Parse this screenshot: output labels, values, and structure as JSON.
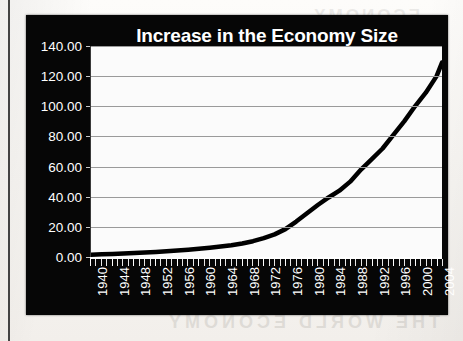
{
  "page": {
    "bleed_top_text": "ECONOMY",
    "bleed_bottom_text": "THE WORLD ECONOMY"
  },
  "chart_panel": {
    "background_color": "#060606",
    "text_color": "#ffffff",
    "plot_background_color": "#fbfbfb",
    "gridline_color": "#9a9a9a",
    "series_color": "#000000"
  },
  "chart_data": {
    "type": "line",
    "title": "Increase in the Economy Size",
    "xlabel": "",
    "ylabel": "",
    "grid": true,
    "legend": false,
    "xlim": [
      1940,
      2005
    ],
    "ylim": [
      0,
      140
    ],
    "yticks": [
      0,
      20,
      40,
      60,
      80,
      100,
      120,
      140
    ],
    "ytick_labels": [
      "0.00",
      "20.00",
      "40.00",
      "60.00",
      "80.00",
      "100.00",
      "120.00",
      "140.00"
    ],
    "xticks": [
      1940,
      1944,
      1948,
      1952,
      1956,
      1960,
      1964,
      1968,
      1972,
      1976,
      1980,
      1984,
      1988,
      1992,
      1996,
      2000,
      2004
    ],
    "xtick_labels": [
      "1940",
      "1944",
      "1948",
      "1952",
      "1956",
      "1960",
      "1964",
      "1968",
      "1972",
      "1976",
      "1980",
      "1984",
      "1988",
      "1992",
      "1996",
      "2000",
      "2004"
    ],
    "x": [
      1940,
      1942,
      1944,
      1946,
      1948,
      1950,
      1952,
      1954,
      1956,
      1958,
      1960,
      1962,
      1964,
      1966,
      1968,
      1970,
      1972,
      1974,
      1976,
      1978,
      1980,
      1982,
      1984,
      1986,
      1988,
      1990,
      1992,
      1994,
      1996,
      1998,
      2000,
      2002,
      2004,
      2005
    ],
    "y": [
      1.5,
      1.8,
      2.0,
      2.3,
      2.6,
      3.0,
      3.4,
      3.8,
      4.3,
      4.8,
      5.4,
      6.1,
      6.9,
      7.8,
      9.0,
      10.5,
      12.5,
      15.0,
      18.5,
      23.5,
      29.0,
      34.5,
      39.5,
      44.0,
      50.0,
      58.0,
      65.0,
      72.0,
      81.0,
      90.0,
      100.0,
      109.0,
      120.0,
      129.0
    ]
  }
}
